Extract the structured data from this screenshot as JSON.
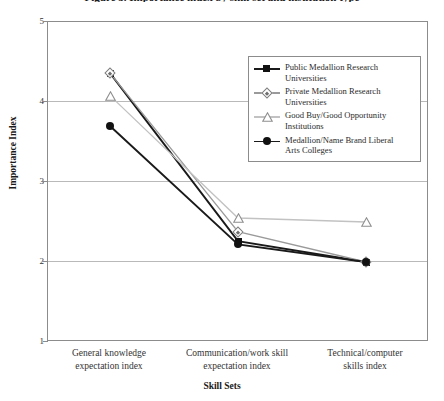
{
  "chart_data": {
    "type": "line",
    "title": "Figure 5. Importance index by skill set and institution type",
    "xlabel": "Skill Sets",
    "ylabel": "Importance Index",
    "ylim": [
      1,
      5
    ],
    "yticks": [
      "1",
      "2",
      "3",
      "4",
      "5"
    ],
    "grid": true,
    "legend_position": "upper-right-inside",
    "categories": [
      "General knowledge expectation index",
      "Communication/work skill expectation index",
      "Technical/computer skills index"
    ],
    "categories_wrapped": [
      [
        "General knowledge",
        "expectation index"
      ],
      [
        "Communication/work skill",
        "expectation index"
      ],
      [
        "Technical/computer",
        "skills index"
      ]
    ],
    "series": [
      {
        "name": "Public Medallion Research Universities",
        "name_wrapped": [
          "Public Medallion Research",
          "Universities"
        ],
        "marker": "filled-square",
        "color": "#111111",
        "line_color": "#1a1a1a",
        "values": [
          4.36,
          2.26,
          2.0
        ]
      },
      {
        "name": "Private Medallion Research Universities",
        "name_wrapped": [
          "Private Medallion Research",
          "Universities"
        ],
        "marker": "diamond-dot",
        "color": "#7d7d7d",
        "line_color": "#9a9a9a",
        "values": [
          4.36,
          2.38,
          2.0
        ]
      },
      {
        "name": "Good Buy/Good Opportunity Institutions",
        "name_wrapped": [
          "Good Buy/Good Opportunity",
          "Institutions"
        ],
        "marker": "triangle",
        "color": "#8f8f8f",
        "line_color": "#c2c2c2",
        "values": [
          4.08,
          2.55,
          2.5
        ]
      },
      {
        "name": "Medallion/Name Brand Liberal Arts Colleges",
        "name_wrapped": [
          "Medallion/Name Brand Liberal",
          "Arts Colleges"
        ],
        "marker": "filled-circle",
        "color": "#111111",
        "line_color": "#1a1a1a",
        "values": [
          3.7,
          2.22,
          2.0
        ]
      }
    ]
  }
}
